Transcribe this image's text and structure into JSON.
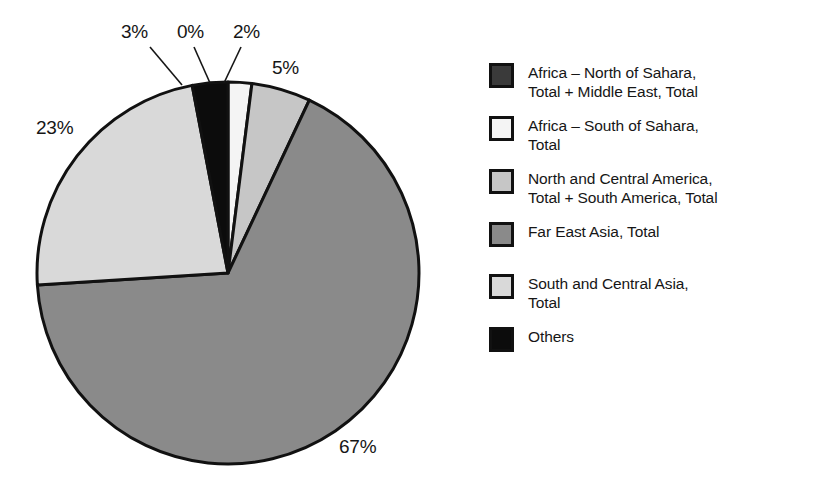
{
  "chart_data": {
    "type": "pie",
    "title": "",
    "subtitle": "",
    "xlabel": "",
    "ylabel": "",
    "grid": false,
    "legend_position": "right",
    "units": "percent",
    "categories": [
      "Africa – North of Sahara, Total + Middle East, Total",
      "Africa – South of Sahara, Total",
      "North and Central America, Total + South America, Total",
      "Far East Asia, Total",
      "South and Central Asia, Total",
      "Others"
    ],
    "values": [
      0,
      2,
      5,
      67,
      23,
      3
    ],
    "value_labels": [
      "0%",
      "2%",
      "5%",
      "67%",
      "23%",
      "3%"
    ],
    "colors": [
      "#3a3a3a",
      "#f4f4f4",
      "#c6c6c6",
      "#8a8a8a",
      "#d9d9d9",
      "#0c0c0c"
    ],
    "start_angle_deg": 0,
    "direction": "clockwise"
  },
  "pie": {
    "geometry": {
      "cx": 228,
      "cy": 273,
      "r": 191,
      "stroke": "#111111",
      "stroke_width": 3
    },
    "labels": [
      {
        "name": "slice-label-others",
        "text": "3%",
        "x": 121,
        "y": 22,
        "leader": [
          150,
          47,
          182,
          85
        ]
      },
      {
        "name": "slice-label-africa-north",
        "text": "0%",
        "x": 177,
        "y": 22,
        "leader": [
          194,
          47,
          210,
          83
        ]
      },
      {
        "name": "slice-label-africa-south",
        "text": "2%",
        "x": 233,
        "y": 22,
        "leader": [
          241,
          47,
          224,
          83
        ]
      },
      {
        "name": "slice-label-americas",
        "text": "5%",
        "x": 272,
        "y": 58,
        "leader": null
      },
      {
        "name": "slice-label-south-central-asia",
        "text": "23%",
        "x": 36,
        "y": 118,
        "leader": null
      },
      {
        "name": "slice-label-far-east-asia",
        "text": "67%",
        "x": 339,
        "y": 437,
        "leader": null
      }
    ]
  },
  "legend": {
    "items": [
      {
        "label": "Africa – North of Sahara,\nTotal + Middle East, Total",
        "color": "#3a3a3a",
        "name": "legend-item-africa-north"
      },
      {
        "label": "Africa – South of Sahara,\nTotal",
        "color": "#f4f4f4",
        "name": "legend-item-africa-south"
      },
      {
        "label": "North and Central America,\nTotal + South America, Total",
        "color": "#c6c6c6",
        "name": "legend-item-americas"
      },
      {
        "label": "Far East Asia, Total",
        "color": "#8a8a8a",
        "name": "legend-item-far-east-asia"
      },
      {
        "label": "South and Central Asia,\nTotal",
        "color": "#d9d9d9",
        "name": "legend-item-south-central-asia"
      },
      {
        "label": "Others",
        "color": "#0c0c0c",
        "name": "legend-item-others"
      }
    ],
    "spacing": [
      14,
      14,
      14,
      26,
      14
    ]
  }
}
